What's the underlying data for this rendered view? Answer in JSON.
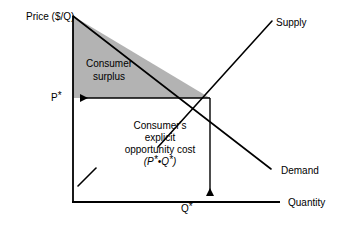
{
  "figure": {
    "background_color": "#ffffff",
    "line_color": "#000000",
    "shaded_region_color": "#b3b3b3"
  },
  "axes": {
    "y_axis_label": "Price ($/Q)",
    "x_axis_label": "Quantity",
    "y_axis_origin_px": [
      73,
      202
    ],
    "y_axis_top_px": [
      73,
      16
    ],
    "x_axis_end_px": [
      280,
      202
    ]
  },
  "curves": {
    "supply": {
      "label": "Supply",
      "from_px": [
        158,
        147
      ],
      "to_px": [
        272,
        21
      ]
    },
    "demand": {
      "label": "Demand",
      "from_px": [
        73,
        16
      ],
      "to_px": [
        271,
        169
      ]
    }
  },
  "equilibrium": {
    "point_px": [
      210,
      98
    ],
    "price_label": "P",
    "price_label_star": "*",
    "quantity_label": "Q",
    "quantity_label_star": "*"
  },
  "regions": {
    "consumer_surplus": {
      "label_line_1": "Consumer",
      "label_line_2": "surplus",
      "fill": "#b3b3b3",
      "vertices_px": [
        [
          73,
          16
        ],
        [
          73,
          98
        ],
        [
          210,
          98
        ]
      ]
    },
    "explicit_opportunity_cost": {
      "label_line_1": "Consumer's",
      "label_line_2": "explicit",
      "label_line_3": "opportunity cost",
      "label_line_4_open": "(",
      "label_line_4_p": "P",
      "label_line_4_star1": "*",
      "label_line_4_dot": "•",
      "label_line_4_q": "Q",
      "label_line_4_star2": "*",
      "label_line_4_close": ")"
    }
  },
  "annotations": {
    "price_arrow": {
      "name": "horizontal-arrow-to-p-star",
      "from_px": [
        210,
        98
      ],
      "to_px": [
        78,
        98
      ],
      "direction": "left"
    },
    "quantity_arrow": {
      "name": "vertical-arrow-to-q-star",
      "from_px": [
        210,
        98
      ],
      "to_px": [
        210,
        198
      ],
      "direction": "down"
    },
    "tick_mark": {
      "name": "diagonal-tick-mark",
      "from_px": [
        78,
        186
      ],
      "to_px": [
        96,
        168
      ]
    }
  }
}
